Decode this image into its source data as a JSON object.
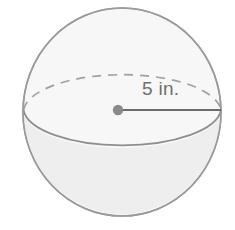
{
  "figure": {
    "name": "sphere-with-radius",
    "kind": "geometry-diagram",
    "shape_name": "sphere",
    "background_color": "#ffffff",
    "outline_color": "#9a9a9a",
    "upper_fill_color": "#f7f7f7",
    "lower_fill_color": "#eeeeee",
    "equator_back_style": "dashed",
    "equator_front_style": "solid",
    "radius_line_color": "#6b6b6b",
    "center_dot_color": "#8a8a8a",
    "label_color": "#6e6e6e"
  },
  "labels": {
    "radius": "5 in."
  },
  "geometry": {
    "sphere_center_x": 122,
    "sphere_center_y": 112,
    "sphere_radius_x": 99,
    "sphere_radius_y": 104,
    "equator_ellipse_ry": 38,
    "center_dot_x": 118,
    "center_dot_y": 110,
    "radius_line_end_x": 221,
    "radius_line_end_y": 110
  }
}
